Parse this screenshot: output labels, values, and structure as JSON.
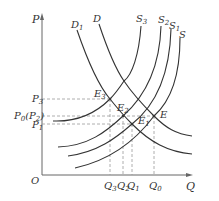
{
  "diagram": {
    "type": "supply-demand-shift",
    "axes": {
      "y_label": "P",
      "x_label": "Q",
      "origin_label": "O"
    },
    "demand_curves": [
      {
        "label": "D1",
        "base": "D",
        "sub": "1"
      },
      {
        "label": "D",
        "base": "D",
        "sub": ""
      }
    ],
    "supply_curves": [
      {
        "label": "S3",
        "base": "S",
        "sub": "3"
      },
      {
        "label": "S2",
        "base": "S",
        "sub": "2"
      },
      {
        "label": "S1",
        "base": "S",
        "sub": "1"
      },
      {
        "label": "S",
        "base": "S",
        "sub": ""
      }
    ],
    "equilibria": [
      {
        "label": "E3",
        "base": "E",
        "sub": "3"
      },
      {
        "label": "E2",
        "base": "E",
        "sub": "2"
      },
      {
        "label": "E1",
        "base": "E",
        "sub": "1"
      },
      {
        "label": "E",
        "base": "E",
        "sub": ""
      }
    ],
    "price_levels": [
      {
        "label": "P3",
        "base": "P",
        "sub": "3",
        "extra": ""
      },
      {
        "label": "P0(P2)",
        "base": "P",
        "sub": "0",
        "extra": "(P",
        "extra_sub": "2",
        "extra_close": ")"
      },
      {
        "label": "P1",
        "base": "P",
        "sub": "1",
        "extra": ""
      }
    ],
    "quantity_levels": [
      {
        "label": "Q3",
        "base": "Q",
        "sub": "3"
      },
      {
        "label": "Q2",
        "base": "Q",
        "sub": "2"
      },
      {
        "label": "Q1",
        "base": "Q",
        "sub": "1"
      },
      {
        "label": "Q0",
        "base": "Q",
        "sub": "0"
      }
    ],
    "colors": {
      "curve": "#333333",
      "axis": "#666666",
      "guide": "#999999"
    }
  }
}
